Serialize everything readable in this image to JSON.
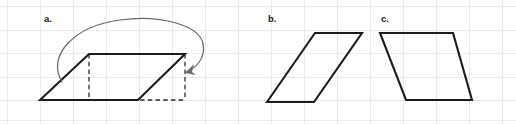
{
  "figure": {
    "width": 516,
    "height": 124,
    "background_color": "#ffffff"
  },
  "grid": {
    "line_color": "#e9e9ee",
    "vertical_x": [
      7,
      40,
      73,
      106,
      139,
      172,
      205,
      238,
      271,
      304,
      337,
      370,
      403,
      436,
      469,
      502
    ],
    "horizontal_y": [
      6,
      30,
      53,
      77,
      100,
      120
    ]
  },
  "panels": [
    {
      "id": "a",
      "label": "a.",
      "label_x": 44,
      "label_y": 22,
      "shape": {
        "name": "sheared-parallelogram",
        "stroke_color": "#1c1c1c",
        "points": "40,100 89,54 185,54 138,100"
      },
      "construction": {
        "name": "dashed-rectangle",
        "stroke_color": "#2a2a2a",
        "segments": [
          "M 89,54 L 89,100",
          "M 185,54 L 185,100",
          "M 40,100 L 185,100"
        ]
      },
      "arrow": {
        "name": "shear-motion-arrow",
        "stroke_color": "#6a6a6a",
        "path": "M 62,82 C 46,56 74,26 120,20 C 162,14 200,26 203,44 C 206,58 196,68 186,72",
        "head_points": "185,73 194,64 192,72 196,75"
      }
    },
    {
      "id": "b",
      "label": "b.",
      "label_x": 268,
      "label_y": 22,
      "shape": {
        "name": "right-leaning-parallelogram",
        "stroke_color": "#1c1c1c",
        "points": "267,102 315,33 362,33 314,102"
      }
    },
    {
      "id": "c",
      "label": "c.",
      "label_x": 381,
      "label_y": 22,
      "shape": {
        "name": "left-leaning-parallelogram",
        "stroke_color": "#1c1c1c",
        "points": "380,33 453,33 472,100 406,100"
      }
    }
  ]
}
